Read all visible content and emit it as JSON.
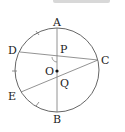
{
  "diagram": {
    "type": "circle-geometry",
    "circle": {
      "center_label": "O"
    },
    "points": [
      {
        "label": "A",
        "x": 57,
        "y": 28
      },
      {
        "label": "B",
        "x": 57,
        "y": 112
      },
      {
        "label": "C",
        "x": 98,
        "y": 60
      },
      {
        "label": "D",
        "x": 20,
        "y": 52
      },
      {
        "label": "E",
        "x": 21,
        "y": 92
      },
      {
        "label": "P",
        "x": 57,
        "y": 56
      },
      {
        "label": "Q",
        "x": 57,
        "y": 77
      },
      {
        "label": "O",
        "x": 57,
        "y": 71
      }
    ],
    "segments": [
      "AB",
      "DC",
      "EC"
    ],
    "labels": {
      "A": "A",
      "B": "B",
      "C": "C",
      "D": "D",
      "E": "E",
      "P": "P",
      "O": "O",
      "Q": "Q"
    },
    "colors": {
      "stroke": "#666666",
      "text": "#222222"
    }
  }
}
